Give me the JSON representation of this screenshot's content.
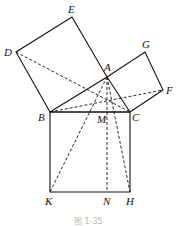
{
  "diagram": {
    "points": {
      "E": {
        "label": "E",
        "x": 72,
        "y": 17
      },
      "D": {
        "label": "D",
        "x": 16,
        "y": 52
      },
      "A": {
        "label": "A",
        "x": 107,
        "y": 77
      },
      "G": {
        "label": "G",
        "x": 145,
        "y": 52
      },
      "F": {
        "label": "F",
        "x": 163,
        "y": 90
      },
      "B": {
        "label": "B",
        "x": 50,
        "y": 112
      },
      "C": {
        "label": "C",
        "x": 130,
        "y": 112
      },
      "M": {
        "label": "M",
        "x": 107,
        "y": 112
      },
      "K": {
        "label": "K",
        "x": 50,
        "y": 192
      },
      "N": {
        "label": "N",
        "x": 107,
        "y": 192
      },
      "H": {
        "label": "H",
        "x": 130,
        "y": 192
      }
    },
    "caption": "图 1-35"
  }
}
